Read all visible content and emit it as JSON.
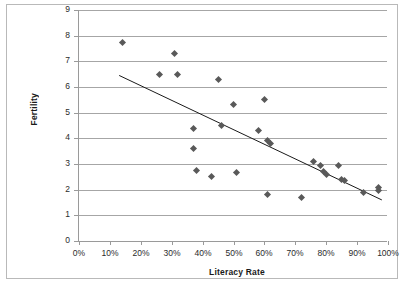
{
  "chart_data": {
    "type": "scatter",
    "title": "",
    "xlabel": "Literacy Rate",
    "ylabel": "Fertility",
    "xlim": [
      0,
      100
    ],
    "ylim": [
      0,
      9
    ],
    "grid": "horizontal",
    "legend": "none",
    "x_tick_labels": [
      "0%",
      "10%",
      "20%",
      "30%",
      "40%",
      "50%",
      "60%",
      "70%",
      "80%",
      "90%",
      "100%"
    ],
    "x_ticks": [
      0,
      10,
      20,
      30,
      40,
      50,
      60,
      70,
      80,
      90,
      100
    ],
    "y_tick_labels": [
      "0",
      "1",
      "2",
      "3",
      "4",
      "5",
      "6",
      "7",
      "8",
      "9"
    ],
    "y_ticks": [
      0,
      1,
      2,
      3,
      4,
      5,
      6,
      7,
      8,
      9
    ],
    "marker": {
      "shape": "diamond",
      "color": "#595959",
      "size": 5
    },
    "points": [
      {
        "x": 14,
        "y": 7.75
      },
      {
        "x": 26,
        "y": 6.5
      },
      {
        "x": 31,
        "y": 7.3
      },
      {
        "x": 32,
        "y": 6.5
      },
      {
        "x": 37,
        "y": 4.4
      },
      {
        "x": 37,
        "y": 3.6
      },
      {
        "x": 38,
        "y": 2.75
      },
      {
        "x": 43,
        "y": 2.5
      },
      {
        "x": 45,
        "y": 6.3
      },
      {
        "x": 46,
        "y": 4.5
      },
      {
        "x": 50,
        "y": 5.3
      },
      {
        "x": 51,
        "y": 2.65
      },
      {
        "x": 58,
        "y": 4.3
      },
      {
        "x": 60,
        "y": 5.5
      },
      {
        "x": 61,
        "y": 3.9
      },
      {
        "x": 61,
        "y": 1.8
      },
      {
        "x": 62,
        "y": 3.8
      },
      {
        "x": 72,
        "y": 1.7
      },
      {
        "x": 76,
        "y": 3.1
      },
      {
        "x": 78,
        "y": 2.95
      },
      {
        "x": 79,
        "y": 2.7
      },
      {
        "x": 80,
        "y": 2.6
      },
      {
        "x": 84,
        "y": 2.95
      },
      {
        "x": 85,
        "y": 2.4
      },
      {
        "x": 86,
        "y": 2.35
      },
      {
        "x": 92,
        "y": 1.9
      },
      {
        "x": 97,
        "y": 2.1
      },
      {
        "x": 97,
        "y": 1.95
      }
    ],
    "trendline": {
      "type": "linear",
      "x_start": 13,
      "y_start": 6.45,
      "x_end": 98,
      "y_end": 1.6,
      "color": "#1a1a1a",
      "width": 1
    }
  }
}
